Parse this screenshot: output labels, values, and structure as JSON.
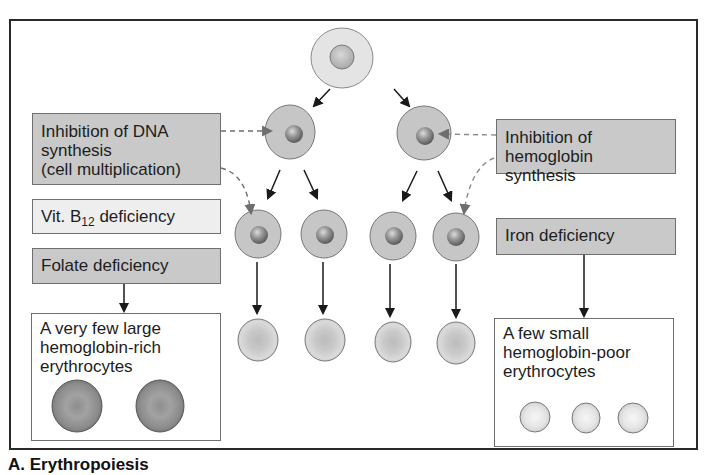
{
  "figure": {
    "caption": "A. Erythropoiesis",
    "colors": {
      "frame": "#2a2a2a",
      "box_dark": "#c9c9c9",
      "box_light": "#eeeeee",
      "cell_cytoplasm": "#c8c8c8",
      "cell_nucleus": "#8a8a8a",
      "erythrocyte": "#d2d2d2",
      "arrow": "#1a1a1a",
      "dashed_arrow": "#777777"
    }
  },
  "left_panel": {
    "dna_inhibition": {
      "line1": "Inhibition of DNA",
      "line2": "synthesis",
      "line3": "(cell multiplication)"
    },
    "vit_b12": {
      "prefix": "Vit. B",
      "subscript": "12",
      "suffix": " deficiency"
    },
    "folate": {
      "label": "Folate deficiency"
    },
    "result": {
      "line1": "A very few large",
      "line2": "hemoglobin-rich",
      "line3": "erythrocytes",
      "cell_count": 2
    }
  },
  "right_panel": {
    "hb_inhibition": {
      "line1": "Inhibition of",
      "line2": "hemoglobin synthesis"
    },
    "iron": {
      "label": "Iron deficiency"
    },
    "result": {
      "line1": "A few small",
      "line2": "hemoglobin-poor",
      "line3": "erythrocytes",
      "cell_count": 3
    }
  },
  "cell_tree": {
    "stem_cell": 1,
    "generation_2": 2,
    "generation_3": 4,
    "mature_erythrocytes": 4
  }
}
